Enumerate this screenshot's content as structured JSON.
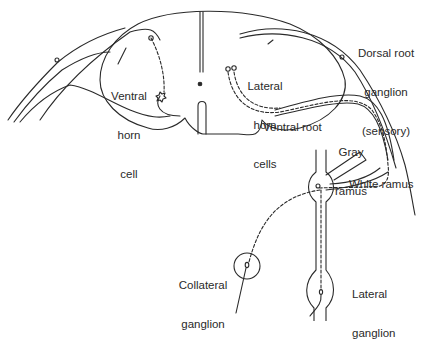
{
  "diagram": {
    "type": "anatomical-line-drawing",
    "colors": {
      "line": "#2a2a2a",
      "background": "#ffffff"
    },
    "labels": {
      "ventral_horn_cell": {
        "line1": "Ventral",
        "line2": "horn",
        "line3": "cell"
      },
      "lateral_horn_cells": {
        "line1": "Lateral",
        "line2": "horn",
        "line3": "cells"
      },
      "dorsal_root_ganglion": {
        "line1": "Dorsal root",
        "line2": "ganglion",
        "line3": "(sensory)"
      },
      "ventral_root": "Ventral root",
      "gray_ramus": {
        "line1": "Gray",
        "line2": "ramus"
      },
      "white_ramus": "White ramus",
      "collateral_ganglion": {
        "line1": "Collateral",
        "line2": "ganglion"
      },
      "lateral_ganglion": {
        "line1": "Lateral",
        "line2": "ganglion"
      }
    }
  }
}
